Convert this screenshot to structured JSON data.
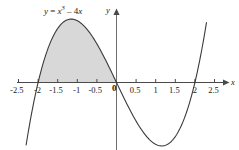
{
  "chart_data": {
    "type": "line",
    "title": "",
    "equation_label": "y = x³ − 4x",
    "equation_parts": {
      "lhs": "y",
      "eq": " = ",
      "base": "x",
      "exp": "3",
      "rest": " – 4",
      "var2": "x"
    },
    "function": "y = x^3 - 4x",
    "xlabel": "x",
    "ylabel": "y",
    "xlim": [
      -2.75,
      2.75
    ],
    "ylim": [
      -3.6,
      3.6
    ],
    "grid": false,
    "legend": null,
    "xticks": [
      -2.5,
      -2,
      -1.5,
      -1,
      -0.5,
      0.5,
      1,
      1.5,
      2,
      2.5
    ],
    "xtick_labels": [
      "-2.5",
      "-2",
      "-1.5",
      "-1",
      "-0.5",
      "0.5",
      "1",
      "1.5",
      "2",
      "2.5"
    ],
    "origin_label": "0",
    "yticks": [],
    "ytick_labels": [],
    "roots": [
      -2,
      0,
      2
    ],
    "local_max": {
      "x": -1.155,
      "y": 3.079
    },
    "local_min": {
      "x": 1.155,
      "y": -3.079
    },
    "shaded_region": {
      "from": -2,
      "to": 0,
      "label": "area under curve",
      "color": "#d8d8d8"
    },
    "curve_color": "#3a3a3a",
    "axis_color": "#4a4a4a",
    "x": [
      -2.3,
      -2.2,
      -2.1,
      -2.0,
      -1.9,
      -1.8,
      -1.7,
      -1.6,
      -1.5,
      -1.4,
      -1.3,
      -1.2,
      -1.1,
      -1.0,
      -0.9,
      -0.8,
      -0.7,
      -0.6,
      -0.5,
      -0.4,
      -0.3,
      -0.2,
      -0.1,
      0,
      0.1,
      0.2,
      0.3,
      0.4,
      0.5,
      0.6,
      0.7,
      0.8,
      0.9,
      1.0,
      1.1,
      1.2,
      1.3,
      1.4,
      1.5,
      1.6,
      1.7,
      1.8,
      1.9,
      2.0,
      2.1,
      2.2,
      2.3
    ],
    "y": [
      -3.03,
      -2.05,
      -1.16,
      -0.37,
      0.74,
      1.37,
      1.89,
      2.3,
      2.62,
      2.86,
      3.0,
      3.07,
      3.07,
      3.0,
      2.87,
      2.69,
      2.46,
      2.18,
      1.88,
      1.54,
      1.17,
      0.79,
      0.4,
      0,
      -0.4,
      -0.79,
      -1.17,
      -1.54,
      -1.88,
      -2.18,
      -2.46,
      -2.69,
      -2.87,
      -3.0,
      -3.07,
      -3.07,
      -3.0,
      -2.86,
      -2.62,
      -2.3,
      -1.89,
      -1.37,
      -0.74,
      0,
      0.37,
      1.16,
      2.05
    ]
  },
  "equation": {
    "y": "y",
    "equals": "=",
    "x_base": "x",
    "exponent": "3",
    "minus_term": "– 4",
    "x_var": "x"
  },
  "axes": {
    "x_label": "x",
    "y_label": "y",
    "origin": "0"
  }
}
